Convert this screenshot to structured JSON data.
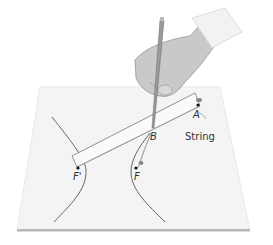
{
  "figure": {
    "labels": {
      "A": "A",
      "B": "B",
      "F": "F",
      "F_prime": "F'",
      "string": "String"
    },
    "colors": {
      "paper": "#f4f4f4",
      "paper_edge": "#b8b8b8",
      "curve": "#555555",
      "ruler": "#fafafa",
      "ruler_edge": "#777777",
      "skin": "#c9c9c9",
      "cuff": "#f2f2f2",
      "pencil": "#9a9a9a",
      "point": "#111111",
      "text": "#333333"
    }
  }
}
